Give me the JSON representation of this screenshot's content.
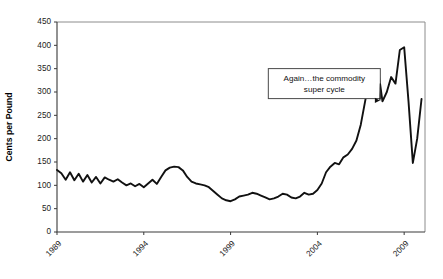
{
  "chart_data": {
    "type": "line",
    "title": "",
    "xlabel": "",
    "ylabel": "Cents per Pound",
    "ylim": [
      0,
      450
    ],
    "ytick_values": [
      0,
      50,
      100,
      150,
      200,
      250,
      300,
      350,
      400,
      450
    ],
    "ytick_labels": [
      "0",
      "50",
      "100",
      "150",
      "200",
      "250",
      "300",
      "350",
      "400",
      "450"
    ],
    "xlim": [
      1989,
      2010.2
    ],
    "xtick_values": [
      1989,
      1994,
      1999,
      2004,
      2009
    ],
    "xtick_labels": [
      "1989",
      "1994",
      "1999",
      "2004",
      "2009"
    ],
    "grid": false,
    "legend": "none",
    "annotations": [
      {
        "text_line1": "Again…the commodity",
        "text_line2": "super cycle",
        "box_x": 2004.4,
        "box_y": 318,
        "arrow_to_x": 2007.6,
        "arrow_to_y": 282
      }
    ],
    "series": [
      {
        "name": "Cents per Pound",
        "color": "#111111",
        "x": [
          1989.0,
          1989.25,
          1989.5,
          1989.75,
          1990.0,
          1990.25,
          1990.5,
          1990.75,
          1991.0,
          1991.25,
          1991.5,
          1991.75,
          1992.0,
          1992.25,
          1992.5,
          1992.75,
          1993.0,
          1993.25,
          1993.5,
          1993.75,
          1994.0,
          1994.25,
          1994.5,
          1994.75,
          1995.0,
          1995.25,
          1995.5,
          1995.75,
          1996.0,
          1996.25,
          1996.5,
          1996.75,
          1997.0,
          1997.25,
          1997.5,
          1997.75,
          1998.0,
          1998.25,
          1998.5,
          1998.75,
          1999.0,
          1999.25,
          1999.5,
          1999.75,
          2000.0,
          2000.25,
          2000.5,
          2000.75,
          2001.0,
          2001.25,
          2001.5,
          2001.75,
          2002.0,
          2002.25,
          2002.5,
          2002.75,
          2003.0,
          2003.25,
          2003.5,
          2003.75,
          2004.0,
          2004.25,
          2004.5,
          2004.75,
          2005.0,
          2005.25,
          2005.5,
          2005.75,
          2006.0,
          2006.25,
          2006.5,
          2006.75,
          2007.0,
          2007.25,
          2007.5,
          2007.75,
          2008.0,
          2008.25,
          2008.5,
          2008.75,
          2009.0,
          2009.25,
          2009.5,
          2009.75,
          2010.0
        ],
        "y": [
          133,
          126,
          112,
          128,
          111,
          125,
          108,
          122,
          106,
          118,
          104,
          117,
          112,
          108,
          113,
          106,
          100,
          104,
          98,
          103,
          96,
          104,
          112,
          103,
          118,
          132,
          138,
          140,
          139,
          132,
          118,
          108,
          104,
          102,
          100,
          96,
          88,
          80,
          72,
          68,
          66,
          70,
          76,
          78,
          80,
          84,
          82,
          78,
          74,
          70,
          72,
          76,
          82,
          80,
          74,
          72,
          76,
          84,
          80,
          82,
          90,
          104,
          128,
          140,
          148,
          145,
          160,
          166,
          178,
          196,
          230,
          280,
          330,
          348,
          348,
          280,
          300,
          332,
          318,
          390,
          396,
          280,
          148,
          200,
          285
        ]
      }
    ]
  }
}
